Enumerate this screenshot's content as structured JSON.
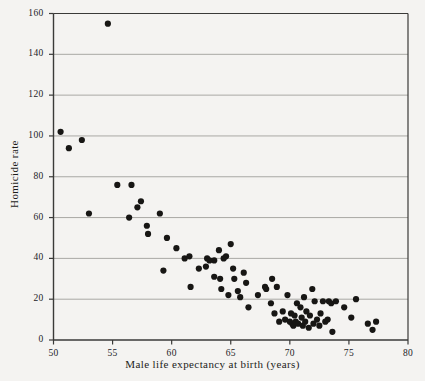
{
  "figure": {
    "background_color": "#f4f3f1",
    "axis_color": "#3a3a38",
    "grid_color": "#a9a8a4",
    "point_color": "#171614",
    "point_radius": 3.1
  },
  "chart_data": {
    "type": "scatter",
    "title": "",
    "xlabel": "Male life expectancy at birth (years)",
    "ylabel": "Homicide rate",
    "xlim": [
      50,
      80
    ],
    "ylim": [
      0,
      160
    ],
    "xticks": [
      50,
      55,
      60,
      65,
      70,
      75,
      80
    ],
    "xtick_labels": [
      "50",
      "55",
      "60",
      "65",
      "70",
      "75",
      "80"
    ],
    "yticks": [
      0,
      20,
      40,
      60,
      80,
      100,
      120,
      140,
      160
    ],
    "ytick_labels": [
      "0",
      "20",
      "40",
      "60",
      "80",
      "100",
      "120",
      "140",
      "160"
    ],
    "grid": "horizontal",
    "legend": "none",
    "series": [
      {
        "name": "countries",
        "points": [
          [
            50.6,
            102
          ],
          [
            51.3,
            94
          ],
          [
            52.4,
            98
          ],
          [
            54.6,
            155
          ],
          [
            53.0,
            62
          ],
          [
            55.4,
            76
          ],
          [
            56.6,
            76
          ],
          [
            56.4,
            60
          ],
          [
            57.1,
            65
          ],
          [
            57.4,
            68
          ],
          [
            57.9,
            56
          ],
          [
            58.0,
            52
          ],
          [
            59.0,
            62
          ],
          [
            59.3,
            34
          ],
          [
            59.6,
            50
          ],
          [
            60.4,
            45
          ],
          [
            61.1,
            40
          ],
          [
            61.5,
            41
          ],
          [
            61.6,
            26
          ],
          [
            62.3,
            35
          ],
          [
            62.9,
            36
          ],
          [
            63.0,
            40
          ],
          [
            63.2,
            39
          ],
          [
            63.6,
            39
          ],
          [
            63.6,
            31
          ],
          [
            64.0,
            44
          ],
          [
            64.1,
            30
          ],
          [
            64.2,
            25
          ],
          [
            64.4,
            40
          ],
          [
            64.6,
            41
          ],
          [
            64.8,
            22
          ],
          [
            65.0,
            47
          ],
          [
            65.2,
            35
          ],
          [
            65.3,
            30
          ],
          [
            65.6,
            24
          ],
          [
            65.8,
            21
          ],
          [
            66.1,
            33
          ],
          [
            66.3,
            28
          ],
          [
            66.5,
            16
          ],
          [
            67.3,
            22
          ],
          [
            67.9,
            26
          ],
          [
            68.0,
            25
          ],
          [
            68.4,
            18
          ],
          [
            68.5,
            30
          ],
          [
            68.7,
            13
          ],
          [
            68.9,
            26
          ],
          [
            69.1,
            9
          ],
          [
            69.4,
            14
          ],
          [
            69.6,
            10
          ],
          [
            69.8,
            22
          ],
          [
            70.0,
            9
          ],
          [
            70.1,
            13
          ],
          [
            70.2,
            8
          ],
          [
            70.3,
            7
          ],
          [
            70.4,
            12
          ],
          [
            70.5,
            9
          ],
          [
            70.6,
            18
          ],
          [
            70.7,
            8
          ],
          [
            70.9,
            16
          ],
          [
            71.0,
            11
          ],
          [
            71.1,
            7
          ],
          [
            71.2,
            21
          ],
          [
            71.3,
            9
          ],
          [
            71.4,
            14
          ],
          [
            71.6,
            6
          ],
          [
            71.7,
            12
          ],
          [
            71.9,
            25
          ],
          [
            72.0,
            8
          ],
          [
            72.1,
            19
          ],
          [
            72.3,
            10
          ],
          [
            72.5,
            7
          ],
          [
            72.6,
            13
          ],
          [
            72.8,
            19
          ],
          [
            73.0,
            9
          ],
          [
            73.2,
            10
          ],
          [
            73.3,
            19
          ],
          [
            73.5,
            18
          ],
          [
            73.6,
            4
          ],
          [
            73.9,
            19
          ],
          [
            74.6,
            16
          ],
          [
            75.2,
            11
          ],
          [
            75.6,
            20
          ],
          [
            76.6,
            8
          ],
          [
            77.0,
            5
          ],
          [
            77.3,
            9
          ]
        ]
      }
    ]
  }
}
